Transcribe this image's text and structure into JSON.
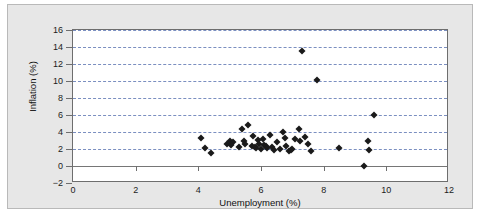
{
  "chart_data": {
    "type": "scatter",
    "title": "",
    "xlabel": "Unemployment (%)",
    "ylabel": "Inflation (%)",
    "xlim": [
      0,
      12
    ],
    "ylim": [
      -2,
      16
    ],
    "xticks": [
      0,
      2,
      4,
      6,
      8,
      10,
      12
    ],
    "yticks": [
      -2,
      0,
      2,
      4,
      6,
      8,
      10,
      12,
      14,
      16
    ],
    "xtick_labels": [
      "0",
      "2",
      "4",
      "6",
      "8",
      "10",
      "12"
    ],
    "ytick_labels": [
      "-2",
      "0",
      "2",
      "4",
      "6",
      "8",
      "10",
      "12",
      "14",
      "16"
    ],
    "grid": "horizontal dashed blue gridlines at even y values 2 through 16",
    "legend": "none",
    "marker": "black diamond",
    "series": [
      {
        "name": "Unemployment vs Inflation",
        "points": [
          [
            4.1,
            3.3
          ],
          [
            4.2,
            2.1
          ],
          [
            4.4,
            1.5
          ],
          [
            4.9,
            2.6
          ],
          [
            5.0,
            2.9
          ],
          [
            5.1,
            2.8
          ],
          [
            5.05,
            2.5
          ],
          [
            5.3,
            2.2
          ],
          [
            5.4,
            4.3
          ],
          [
            5.45,
            3.0
          ],
          [
            5.5,
            2.6
          ],
          [
            5.6,
            4.8
          ],
          [
            5.7,
            2.3
          ],
          [
            5.75,
            3.5
          ],
          [
            5.8,
            2.2
          ],
          [
            5.85,
            2.1
          ],
          [
            5.9,
            3.1
          ],
          [
            5.95,
            2.6
          ],
          [
            6.0,
            2.0
          ],
          [
            6.05,
            3.2
          ],
          [
            6.1,
            2.5
          ],
          [
            6.15,
            2.3
          ],
          [
            6.2,
            2.15
          ],
          [
            6.3,
            3.6
          ],
          [
            6.35,
            2.2
          ],
          [
            6.4,
            1.9
          ],
          [
            6.5,
            2.8
          ],
          [
            6.6,
            2.0
          ],
          [
            6.7,
            4.0
          ],
          [
            6.75,
            3.3
          ],
          [
            6.8,
            2.4
          ],
          [
            6.9,
            1.8
          ],
          [
            6.95,
            1.9
          ],
          [
            7.0,
            2.0
          ],
          [
            7.1,
            3.2
          ],
          [
            7.2,
            4.3
          ],
          [
            7.25,
            2.9
          ],
          [
            7.3,
            13.5
          ],
          [
            7.4,
            3.4
          ],
          [
            7.5,
            2.6
          ],
          [
            7.6,
            1.8
          ],
          [
            7.8,
            10.1
          ],
          [
            8.5,
            2.1
          ],
          [
            9.3,
            0.05
          ],
          [
            9.4,
            3.0
          ],
          [
            9.45,
            1.9
          ],
          [
            9.6,
            6.0
          ]
        ]
      }
    ]
  }
}
